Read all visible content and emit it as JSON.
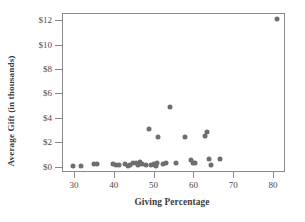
{
  "chart_data": {
    "type": "scatter",
    "title": "",
    "xlabel": "Giving Percentage",
    "ylabel": "Average Gift (in thousands)",
    "xlim": [
      27,
      83
    ],
    "ylim": [
      -0.45,
      12.6
    ],
    "xticks": [
      30,
      40,
      50,
      60,
      70,
      80
    ],
    "xticklabels": [
      "30",
      "40",
      "50",
      "60",
      "70",
      "80"
    ],
    "yticks": [
      0,
      2,
      4,
      6,
      8,
      10,
      12
    ],
    "yticklabels": [
      "$0",
      "$2",
      "$4",
      "$6",
      "$8",
      "$10",
      "$12"
    ],
    "grid": false,
    "legend": null,
    "marker": {
      "shape": "circle",
      "color": "#6e6e6e",
      "size": 5
    },
    "series": [
      {
        "name": "Institutions",
        "points": [
          {
            "x": 29.8,
            "y": 0.05
          },
          {
            "x": 31.8,
            "y": 0.05
          },
          {
            "x": 35.0,
            "y": 0.2
          },
          {
            "x": 35.9,
            "y": 0.2
          },
          {
            "x": 39.9,
            "y": 0.2
          },
          {
            "x": 40.6,
            "y": 0.1
          },
          {
            "x": 41.2,
            "y": 0.15
          },
          {
            "x": 42.8,
            "y": 0.2
          },
          {
            "x": 43.6,
            "y": 0.05
          },
          {
            "x": 44.2,
            "y": 0.1
          },
          {
            "x": 44.9,
            "y": 0.25
          },
          {
            "x": 45.5,
            "y": 0.3
          },
          {
            "x": 46.0,
            "y": 0.1
          },
          {
            "x": 46.6,
            "y": 0.35
          },
          {
            "x": 47.2,
            "y": 0.2
          },
          {
            "x": 48.0,
            "y": 0.1
          },
          {
            "x": 48.8,
            "y": 3.05
          },
          {
            "x": 49.4,
            "y": 0.15
          },
          {
            "x": 50.0,
            "y": 0.2
          },
          {
            "x": 50.3,
            "y": 0.1
          },
          {
            "x": 50.5,
            "y": 0.05
          },
          {
            "x": 50.8,
            "y": 0.25
          },
          {
            "x": 51.0,
            "y": 2.4
          },
          {
            "x": 52.3,
            "y": 0.2
          },
          {
            "x": 53.2,
            "y": 0.25
          },
          {
            "x": 54.0,
            "y": 4.9
          },
          {
            "x": 55.6,
            "y": 0.3
          },
          {
            "x": 57.9,
            "y": 2.4
          },
          {
            "x": 59.5,
            "y": 0.5
          },
          {
            "x": 60.0,
            "y": 0.25
          },
          {
            "x": 60.4,
            "y": 0.3
          },
          {
            "x": 62.8,
            "y": 2.5
          },
          {
            "x": 63.5,
            "y": 2.85
          },
          {
            "x": 63.9,
            "y": 0.6
          },
          {
            "x": 64.4,
            "y": 0.15
          },
          {
            "x": 66.7,
            "y": 0.65
          },
          {
            "x": 81.0,
            "y": 12.1
          }
        ]
      }
    ]
  }
}
